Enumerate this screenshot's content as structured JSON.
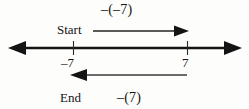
{
  "figure": {
    "type": "number-line-diagram",
    "title_text": "",
    "background_color": "#fdfdfc",
    "ink_color": "#141414",
    "labels": {
      "top_operation": "–(–7)",
      "start": "Start",
      "end": "End",
      "bottom_operation": "–(7)",
      "tick_left": "–7",
      "tick_right": "7"
    },
    "number_line": {
      "y": 48,
      "x_left": 10,
      "x_right": 240,
      "left_arrowhead": true,
      "right_arrowhead": true,
      "ticks": [
        {
          "value": "-7",
          "label": "–7",
          "x": 73
        },
        {
          "value": "7",
          "label": "7",
          "x": 187
        }
      ]
    },
    "arrows": [
      {
        "name": "start-arrow",
        "direction": "right",
        "y": 31,
        "x_from": 93,
        "x_to": 187,
        "label": "–(–7)"
      },
      {
        "name": "end-arrow",
        "direction": "left",
        "y": 75,
        "x_from": 187,
        "x_to": 72,
        "label": "–(7)"
      }
    ]
  }
}
